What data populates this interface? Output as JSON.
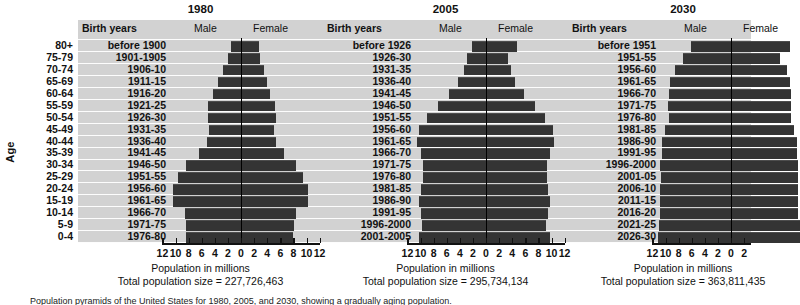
{
  "figure": {
    "age_axis_title": "Age",
    "age_groups": [
      "80+",
      "75-79",
      "70-74",
      "65-69",
      "60-64",
      "55-59",
      "50-54",
      "45-49",
      "40-44",
      "35-39",
      "30-34",
      "25-29",
      "20-24",
      "15-19",
      "10-14",
      "5-9",
      "0-4"
    ],
    "col_header_birth_years": "Birth years",
    "col_header_male": "Male",
    "col_header_female": "Female",
    "x_caption": "Population in millions",
    "x_tick_labels": [
      "12",
      "10",
      "8",
      "6",
      "4",
      "2",
      "0",
      "2",
      "4",
      "6",
      "8",
      "10",
      "12"
    ],
    "footnote": "Population pyramids of the United States for 1980, 2005, and 2030, showing a gradually aging population."
  },
  "chart_data": {
    "type": "bar",
    "xlabel": "Population in millions",
    "ylabel": "Age",
    "xlim": [
      -12,
      12
    ],
    "grid": true,
    "legend": [
      "Male",
      "Female"
    ],
    "legend_position": "top",
    "categories": [
      "80+",
      "75-79",
      "70-74",
      "65-69",
      "60-64",
      "55-59",
      "50-54",
      "45-49",
      "40-44",
      "35-39",
      "30-34",
      "25-29",
      "20-24",
      "15-19",
      "10-14",
      "5-9",
      "0-4"
    ],
    "panels": [
      {
        "year": "1980",
        "total_population_label": "Total population size = 227,726,463",
        "total_population": 227726463,
        "birth_years": [
          "before 1900",
          "1901-1905",
          "1906-10",
          "1911-15",
          "1916-20",
          "1921-25",
          "1926-30",
          "1931-35",
          "1936-40",
          "1941-45",
          "1946-50",
          "1951-55",
          "1956-60",
          "1961-65",
          "1966-70",
          "1971-75",
          "1976-80"
        ],
        "series": [
          {
            "name": "Male",
            "values": [
              1.6,
              2.0,
              2.8,
              3.5,
              4.2,
              5.0,
              5.1,
              4.9,
              5.2,
              6.4,
              8.4,
              9.6,
              10.4,
              10.4,
              8.6,
              8.4,
              8.4
            ]
          },
          {
            "name": "Female",
            "values": [
              2.8,
              2.9,
              3.5,
              4.0,
              4.5,
              5.2,
              5.3,
              5.1,
              5.4,
              6.5,
              8.4,
              9.5,
              10.3,
              10.3,
              8.4,
              8.1,
              8.0
            ]
          }
        ]
      },
      {
        "year": "2005",
        "total_population_label": "Total population size = 295,734,134",
        "total_population": 295734134,
        "birth_years": [
          "before 1926",
          "1926-30",
          "1931-35",
          "1936-40",
          "1941-45",
          "1946-50",
          "1951-55",
          "1956-60",
          "1961-65",
          "1966-70",
          "1971-75",
          "1976-80",
          "1981-85",
          "1986-90",
          "1991-95",
          "1996-2000",
          "2001-2005"
        ],
        "series": [
          {
            "name": "Male",
            "values": [
              2.2,
              2.9,
              3.4,
              4.2,
              5.6,
              7.4,
              9.0,
              10.3,
              10.6,
              9.9,
              9.6,
              9.6,
              9.9,
              10.3,
              9.9,
              9.7,
              10.2
            ]
          },
          {
            "name": "Female",
            "values": [
              4.7,
              3.4,
              3.8,
              4.5,
              5.8,
              7.5,
              9.0,
              10.2,
              10.4,
              9.7,
              9.3,
              9.3,
              9.5,
              9.8,
              9.4,
              9.2,
              9.7
            ]
          }
        ]
      },
      {
        "year": "2030",
        "total_population_label": "Total population size = 363,811,435",
        "total_population": 363811435,
        "birth_years": [
          "before 1951",
          "1951-55",
          "1956-60",
          "1961-65",
          "1966-70",
          "1971-75",
          "1976-80",
          "1981-85",
          "1986-90",
          "1991-95",
          "1996-2000",
          "2001-05",
          "2006-10",
          "2011-15",
          "2016-20",
          "2021-25",
          "2026-30"
        ],
        "series": [
          {
            "name": "Male",
            "values": [
              6.1,
              7.4,
              8.6,
              9.3,
              9.5,
              9.6,
              9.5,
              10.1,
              10.6,
              10.6,
              10.9,
              10.7,
              10.8,
              10.8,
              10.8,
              11.0,
              11.1
            ]
          },
          {
            "name": "Female",
            "values": [
              9.0,
              7.5,
              8.5,
              9.0,
              9.1,
              9.2,
              9.1,
              9.6,
              10.1,
              10.0,
              10.3,
              10.2,
              10.3,
              10.3,
              10.3,
              10.5,
              10.6
            ]
          }
        ]
      }
    ]
  }
}
